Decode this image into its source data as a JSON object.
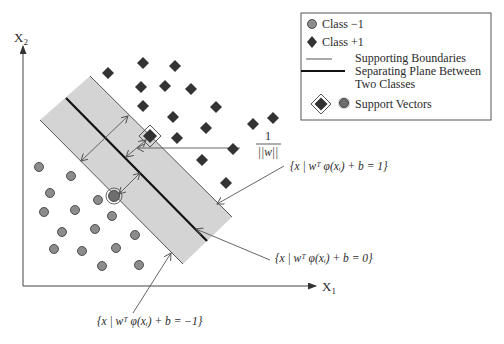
{
  "diagram": {
    "type": "svm-margin-illustration",
    "axes": {
      "x_label": "X",
      "x_sub": "1",
      "y_label": "X",
      "y_sub": "2"
    },
    "legend": {
      "items": [
        {
          "symbol": "circle",
          "label": "Class −1"
        },
        {
          "symbol": "diamond",
          "label": "Class +1"
        },
        {
          "symbol": "thin-line",
          "label": "Supporting Boundaries"
        },
        {
          "symbol": "thick-line",
          "label_line1": "Separating Plane Between",
          "label_line2": "Two Classes"
        },
        {
          "symbol": "support-vectors",
          "label": "Support Vectors"
        }
      ]
    },
    "annotations": {
      "margin_num": "1",
      "margin_den": "||w||",
      "eq_plus": "{x | wᵀ φ(xᵢ) + b = 1}",
      "eq_zero": "{x | wᵀ φ(xᵢ) + b = 0}",
      "eq_minus": "{x | wᵀ φ(xᵢ) + b = −1}"
    },
    "colors": {
      "circle_fill": "#8c8c8c",
      "diamond_fill": "#333333",
      "band_fill": "#d4d4d4",
      "line": "#555555",
      "separator": "#111111"
    },
    "class_plus_points": [
      [
        108,
        73
      ],
      [
        143,
        63
      ],
      [
        175,
        66
      ],
      [
        141,
        87
      ],
      [
        165,
        86
      ],
      [
        191,
        89
      ],
      [
        143,
        106
      ],
      [
        216,
        107
      ],
      [
        173,
        117
      ],
      [
        206,
        128
      ],
      [
        253,
        124
      ],
      [
        273,
        118
      ],
      [
        177,
        138
      ],
      [
        233,
        149
      ],
      [
        202,
        160
      ],
      [
        226,
        183
      ]
    ],
    "class_minus_points": [
      [
        39,
        167
      ],
      [
        71,
        176
      ],
      [
        50,
        193
      ],
      [
        44,
        212
      ],
      [
        75,
        210
      ],
      [
        98,
        200
      ],
      [
        112,
        216
      ],
      [
        62,
        232
      ],
      [
        95,
        229
      ],
      [
        135,
        235
      ],
      [
        54,
        249
      ],
      [
        82,
        251
      ],
      [
        116,
        248
      ],
      [
        102,
        266
      ],
      [
        139,
        265
      ]
    ],
    "support_vectors": {
      "plus": [
        150,
        136
      ],
      "minus": [
        114,
        196
      ]
    }
  }
}
